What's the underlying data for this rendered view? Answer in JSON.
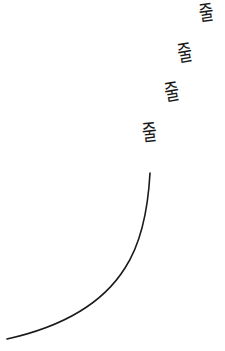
{
  "drawing": {
    "glyphs": [
      {
        "text": "줄"
      },
      {
        "text": "줄"
      },
      {
        "text": "줄"
      },
      {
        "text": "줄"
      }
    ],
    "curve": {
      "color": "#1a1a1a",
      "description": "hand-drawn curved line"
    }
  }
}
